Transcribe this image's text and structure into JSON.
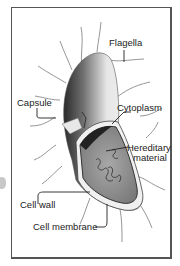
{
  "diagram": {
    "labels": {
      "flagella": "Flagella",
      "capsule": "Capsule",
      "cytoplasm": "Cytoplasm",
      "hereditary_line1": "Hereditary",
      "hereditary_line2": "material",
      "cell_wall": "Cell wall",
      "cell_membrane": "Cell membrane"
    },
    "colors": {
      "frame": "#555555",
      "cell_body_light": "#f2f2f2",
      "cell_body_dark": "#3a3a3a",
      "cytoplasm": "#9a9a9a",
      "leader_line": "#222222",
      "flagella": "#8a8a8a"
    }
  }
}
